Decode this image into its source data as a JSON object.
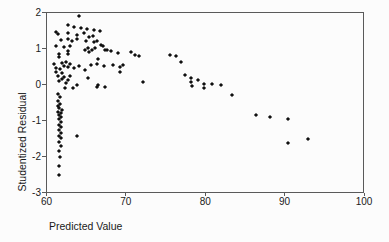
{
  "figure": {
    "background_color": "#fcfcfc",
    "marker_color": "#101010",
    "axis_color": "#5a5a5a",
    "text_color": "#1a1a1a"
  },
  "chart_data": {
    "type": "scatter",
    "title": "",
    "xlabel": "Predicted Value",
    "ylabel": "Studentized Residual",
    "xlim": [
      60,
      100
    ],
    "ylim": [
      -3,
      2
    ],
    "x_ticks": [
      60,
      70,
      80,
      90,
      100
    ],
    "y_ticks": [
      2,
      1,
      0,
      -1,
      -2,
      -3
    ],
    "grid": false,
    "legend": null,
    "marker": "diamond",
    "points": [
      [
        64.1,
        1.89
      ],
      [
        62.7,
        1.64
      ],
      [
        63.5,
        1.59
      ],
      [
        64.3,
        1.56
      ],
      [
        65.1,
        1.53
      ],
      [
        66.0,
        1.52
      ],
      [
        66.7,
        1.48
      ],
      [
        61.2,
        1.47
      ],
      [
        61.5,
        1.41
      ],
      [
        62.7,
        1.43
      ],
      [
        63.9,
        1.38
      ],
      [
        64.7,
        1.42
      ],
      [
        65.8,
        1.35
      ],
      [
        65.3,
        1.31
      ],
      [
        61.8,
        1.24
      ],
      [
        62.7,
        1.27
      ],
      [
        63.2,
        1.21
      ],
      [
        63.9,
        1.26
      ],
      [
        65.0,
        1.2
      ],
      [
        66.3,
        1.2
      ],
      [
        66.0,
        1.17
      ],
      [
        66.9,
        1.09
      ],
      [
        67.1,
        1.07
      ],
      [
        61.2,
        1.08
      ],
      [
        62.2,
        1.04
      ],
      [
        62.9,
        1.06
      ],
      [
        66.1,
        1.02
      ],
      [
        65.2,
        1.02
      ],
      [
        64.9,
        0.95
      ],
      [
        65.7,
        0.95
      ],
      [
        67.6,
        0.97
      ],
      [
        67.4,
        0.96
      ],
      [
        62.7,
        0.93
      ],
      [
        61.6,
        0.86
      ],
      [
        62.7,
        0.86
      ],
      [
        65.4,
        0.89
      ],
      [
        68.1,
        0.92
      ],
      [
        69.0,
        0.88
      ],
      [
        70.7,
        0.91
      ],
      [
        71.1,
        0.83
      ],
      [
        71.6,
        0.78
      ],
      [
        61.6,
        0.77
      ],
      [
        66.5,
        0.72
      ],
      [
        75.6,
        0.83
      ],
      [
        76.3,
        0.79
      ],
      [
        76.9,
        0.63
      ],
      [
        61.0,
        0.58
      ],
      [
        61.9,
        0.61
      ],
      [
        62.4,
        0.63
      ],
      [
        63.0,
        0.58
      ],
      [
        64.1,
        0.52
      ],
      [
        62.2,
        0.52
      ],
      [
        65.6,
        0.54
      ],
      [
        66.4,
        0.56
      ],
      [
        67.3,
        0.52
      ],
      [
        68.4,
        0.55
      ],
      [
        69.3,
        0.5
      ],
      [
        69.7,
        0.53
      ],
      [
        69.2,
        0.34
      ],
      [
        61.2,
        0.46
      ],
      [
        61.7,
        0.44
      ],
      [
        62.7,
        0.49
      ],
      [
        63.5,
        0.46
      ],
      [
        64.8,
        0.4
      ],
      [
        61.2,
        0.35
      ],
      [
        62.0,
        0.33
      ],
      [
        61.4,
        0.24
      ],
      [
        62.2,
        0.21
      ],
      [
        62.9,
        0.24
      ],
      [
        61.9,
        0.15
      ],
      [
        62.7,
        0.12
      ],
      [
        65.2,
        0.19
      ],
      [
        61.6,
        0.09
      ],
      [
        62.4,
        0.05
      ],
      [
        63.9,
        0.0
      ],
      [
        66.5,
        0.0
      ],
      [
        72.2,
        0.06
      ],
      [
        62.3,
        -0.1
      ],
      [
        63.3,
        -0.1
      ],
      [
        66.3,
        -0.06
      ],
      [
        67.4,
        -0.08
      ],
      [
        77.5,
        0.27
      ],
      [
        78.2,
        0.19
      ],
      [
        78.2,
        0.06
      ],
      [
        78.3,
        -0.05
      ],
      [
        79.1,
        0.13
      ],
      [
        79.9,
        0.02
      ],
      [
        79.9,
        -0.1
      ],
      [
        80.9,
        0.02
      ],
      [
        82.0,
        -0.01
      ],
      [
        83.4,
        -0.29
      ],
      [
        86.4,
        -0.84
      ],
      [
        88.2,
        -0.91
      ],
      [
        90.4,
        -0.95
      ],
      [
        90.4,
        -1.62
      ],
      [
        93.0,
        -1.51
      ],
      [
        61.5,
        -0.26
      ],
      [
        61.7,
        -0.35
      ],
      [
        61.4,
        -0.47
      ],
      [
        61.7,
        -0.54
      ],
      [
        61.4,
        -0.6
      ],
      [
        61.6,
        -0.66
      ],
      [
        61.9,
        -0.7
      ],
      [
        61.5,
        -0.75
      ],
      [
        61.8,
        -0.79
      ],
      [
        61.6,
        -0.84
      ],
      [
        61.8,
        -0.91
      ],
      [
        61.6,
        -0.97
      ],
      [
        61.8,
        -1.05
      ],
      [
        61.6,
        -1.12
      ],
      [
        61.8,
        -1.19
      ],
      [
        61.6,
        -1.27
      ],
      [
        61.8,
        -1.34
      ],
      [
        61.6,
        -1.42
      ],
      [
        61.8,
        -1.49
      ],
      [
        61.6,
        -1.6
      ],
      [
        61.8,
        -1.71
      ],
      [
        61.6,
        -1.84
      ],
      [
        61.7,
        -2.02
      ],
      [
        61.6,
        -2.25
      ],
      [
        61.6,
        -2.51
      ],
      [
        63.9,
        -1.42
      ]
    ]
  }
}
